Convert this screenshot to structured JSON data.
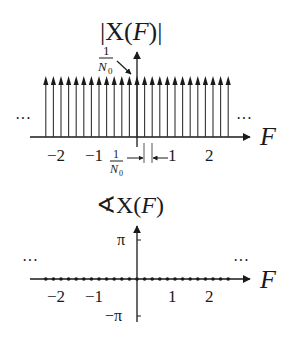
{
  "chart_data": [
    {
      "type": "stem",
      "title": "|X(F)|",
      "xlabel": "F",
      "ylabel": "",
      "description": "Magnitude spectrum: uniform impulse train of height 1/N0 spaced 1/N0 apart, extending infinitely in both directions",
      "impulse_height_label": {
        "num": "1",
        "den": "N",
        "den_sub": "0"
      },
      "spacing_label": {
        "num": "1",
        "den": "N",
        "den_sub": "0"
      },
      "x_ticks": [
        "-2",
        "-1",
        "1",
        "2"
      ],
      "continuation": "...",
      "impulse_count_visible": 25,
      "impulses_per_unit": 5
    },
    {
      "type": "scatter",
      "title": "∢X(F)",
      "xlabel": "F",
      "description": "Phase spectrum: zero at every harmonic",
      "y_ticks": [
        "π",
        "−π"
      ],
      "x_ticks": [
        "-2",
        "-1",
        "1",
        "2"
      ],
      "values_all": 0,
      "points_visible": 25,
      "continuation": "..."
    }
  ],
  "labels": {
    "top_title_bar": "|",
    "top_title_X": "X(",
    "top_title_F": "F",
    "top_title_close": ")|",
    "axis_F": "F",
    "ellipsis": "···",
    "one": "1",
    "N": "N",
    "zero": "0",
    "tick_m2": "−2",
    "tick_m1": "−1",
    "tick_1": "1",
    "tick_2": "2",
    "phase_title_angle": "∢",
    "phase_title_X": "X(",
    "phase_title_F": "F",
    "phase_title_close": ")",
    "pi": "π",
    "neg_pi": "−π"
  }
}
